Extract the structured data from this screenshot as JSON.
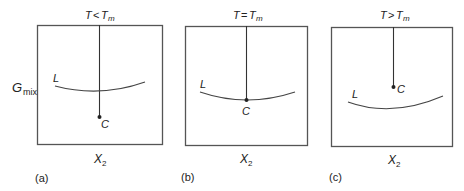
{
  "y_axis_label": {
    "main": "G",
    "sub": "mix"
  },
  "colors": {
    "line": "#333333",
    "frame": "#555555",
    "text": "#222222"
  },
  "panels": [
    {
      "id": "a",
      "caption": "(a)",
      "title": {
        "T": "T",
        "relation": "<",
        "Tm": "T",
        "Tm_sub": "m"
      },
      "x_label": {
        "main": "X",
        "sub": "2"
      },
      "curve_label": "L",
      "point_label": "C",
      "condition": "solid point C lies below liquid curve L"
    },
    {
      "id": "b",
      "caption": "(b)",
      "title": {
        "T": "T",
        "relation": "=",
        "Tm": "T",
        "Tm_sub": "m"
      },
      "x_label": {
        "main": "X",
        "sub": "2"
      },
      "curve_label": "L",
      "point_label": "C",
      "condition": "solid point C lies on liquid curve L"
    },
    {
      "id": "c",
      "caption": "(c)",
      "title": {
        "T": "T",
        "relation": ">",
        "Tm": "T",
        "Tm_sub": "m"
      },
      "x_label": {
        "main": "X",
        "sub": "2"
      },
      "curve_label": "L",
      "point_label": "C",
      "condition": "solid point C lies above liquid curve L"
    }
  ]
}
